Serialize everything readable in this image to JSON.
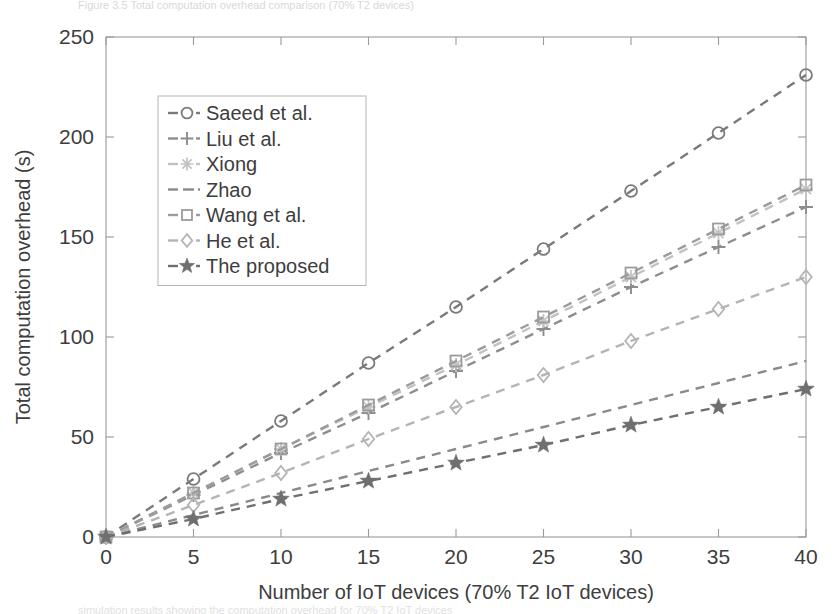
{
  "figure": {
    "caption_top": "Figure 3.5    Total computation overhead comparison (70% T2 devices)",
    "caption_bottom": "simulation results showing the computation overhead for 70% T2 IoT devices"
  },
  "chart_data": {
    "type": "line",
    "title": "",
    "xlabel": "Number of IoT devices (70% T2 IoT devices)",
    "ylabel": "Total computation overhead (s)",
    "xlim": [
      0,
      40
    ],
    "ylim": [
      0,
      250
    ],
    "xticks": [
      0,
      5,
      10,
      15,
      20,
      25,
      30,
      35,
      40
    ],
    "yticks": [
      0,
      50,
      100,
      150,
      200,
      250
    ],
    "grid": false,
    "legend_position": "upper-left-inset",
    "x": [
      0,
      5,
      10,
      15,
      20,
      25,
      30,
      35,
      40
    ],
    "series": [
      {
        "name": "Saeed et al.",
        "marker": "circle",
        "color": "#7a7a7a",
        "values": [
          0,
          29,
          58,
          87,
          115,
          144,
          173,
          202,
          231
        ]
      },
      {
        "name": "Liu et al.",
        "marker": "plus",
        "color": "#8d8d8d",
        "values": [
          0,
          21,
          42,
          62,
          83,
          104,
          125,
          145,
          165
        ]
      },
      {
        "name": "Xiong",
        "marker": "asterisk",
        "color": "#c2c2c2",
        "values": [
          0,
          22,
          44,
          65,
          86,
          108,
          130,
          152,
          174
        ]
      },
      {
        "name": "Zhao",
        "marker": "none",
        "color": "#8a8a8a",
        "values": [
          0,
          11,
          22,
          33,
          44,
          55,
          66,
          77,
          88
        ]
      },
      {
        "name": "Wang et al.",
        "marker": "square",
        "color": "#9b9b9b",
        "values": [
          0,
          22,
          44,
          66,
          88,
          110,
          132,
          154,
          176
        ]
      },
      {
        "name": "He et al.",
        "marker": "diamond",
        "color": "#b4b4b4",
        "values": [
          0,
          16,
          32,
          49,
          65,
          81,
          98,
          114,
          130
        ]
      },
      {
        "name": "The proposed",
        "marker": "star",
        "color": "#6f6f6f",
        "values": [
          0,
          9,
          19,
          28,
          37,
          46,
          56,
          65,
          74
        ]
      }
    ]
  },
  "legend": {
    "entries": [
      {
        "label": "Saeed et al.",
        "marker": "circle"
      },
      {
        "label": "Liu et al.",
        "marker": "plus"
      },
      {
        "label": "Xiong",
        "marker": "asterisk"
      },
      {
        "label": "Zhao",
        "marker": "none"
      },
      {
        "label": "Wang et al.",
        "marker": "square"
      },
      {
        "label": "He et al.",
        "marker": "diamond"
      },
      {
        "label": "The proposed",
        "marker": "star"
      }
    ]
  }
}
